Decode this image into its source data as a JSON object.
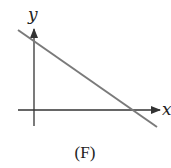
{
  "figure": {
    "caption": "(F)",
    "axes": {
      "x_label": "x",
      "y_label": "y",
      "axis_color": "#333333"
    },
    "line": {
      "description": "straight line with negative slope, positive y-intercept and positive x-intercept",
      "color": "#7a7a7a",
      "slope_sign": "negative",
      "y_intercept_sign": "positive",
      "x_intercept_sign": "positive"
    }
  }
}
